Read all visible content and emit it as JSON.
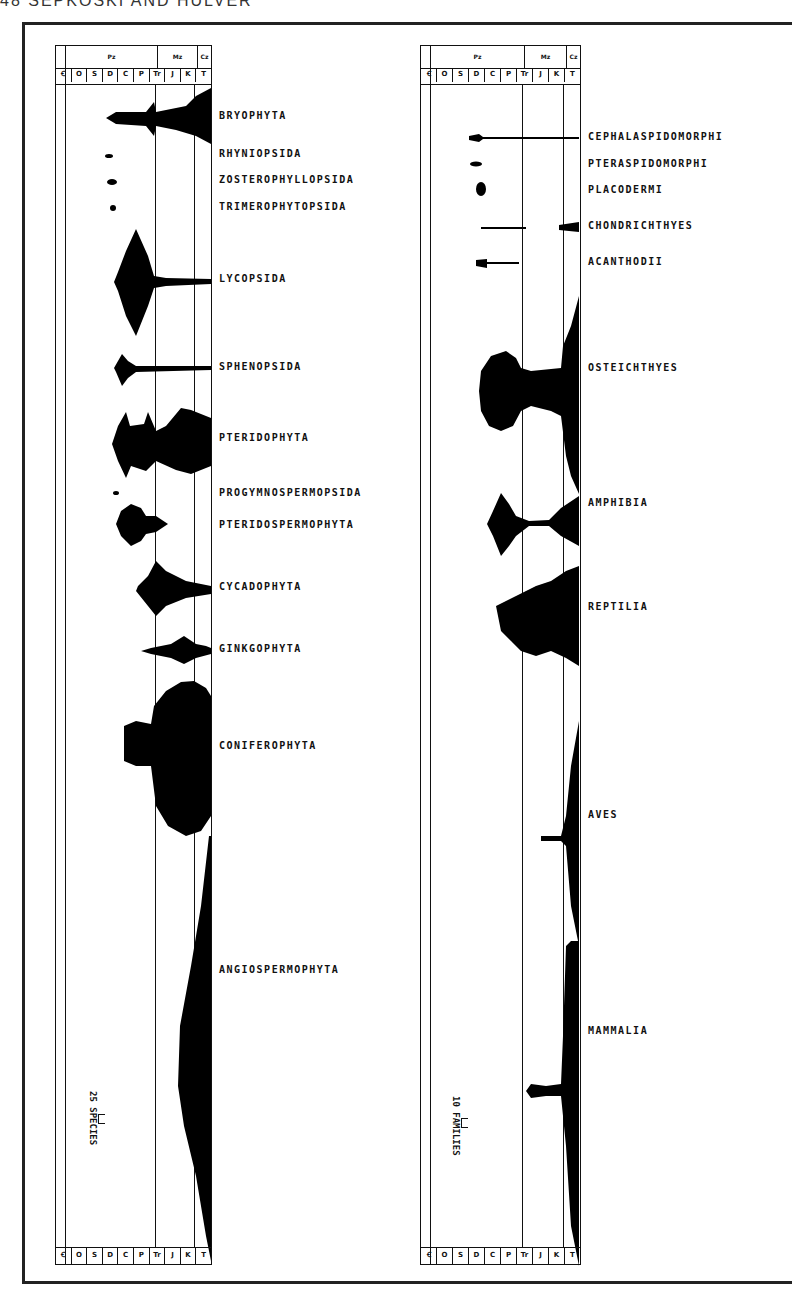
{
  "page": {
    "running_head": "48  SEPKOSKI AND HULVER"
  },
  "left_panel": {
    "timescale_periods": [
      "Ꞓ",
      "O",
      "S",
      "D",
      "C",
      "P",
      "Tr",
      "J",
      "K",
      "T"
    ],
    "timescale_eras": [
      "Pz",
      "Mz",
      "Cz"
    ],
    "scale_label": "25 SPECIES",
    "taxa": [
      {
        "name": "BRYOPHYTA"
      },
      {
        "name": "RHYNIOPSIDA"
      },
      {
        "name": "ZOSTEROPHYLLOPSIDA"
      },
      {
        "name": "TRIMEROPHYTOPSIDA"
      },
      {
        "name": "LYCOPSIDA"
      },
      {
        "name": "SPHENOPSIDA"
      },
      {
        "name": "PTERIDOPHYTA"
      },
      {
        "name": "PROGYMNOSPERMOPSIDA"
      },
      {
        "name": "PTERIDOSPERMOPHYTA"
      },
      {
        "name": "CYCADOPHYTA"
      },
      {
        "name": "GINKGOPHYTA"
      },
      {
        "name": "CONIFEROPHYTA"
      },
      {
        "name": "ANGIOSPERMOPHYTA"
      }
    ]
  },
  "right_panel": {
    "timescale_periods": [
      "Ꞓ",
      "O",
      "S",
      "D",
      "C",
      "P",
      "Tr",
      "J",
      "K",
      "T"
    ],
    "timescale_eras": [
      "Pz",
      "Mz",
      "Cz"
    ],
    "scale_label": "10 FAMILIES",
    "taxa": [
      {
        "name": "CEPHALASPIDOMORPHI"
      },
      {
        "name": "PTERASPIDOMORPHI"
      },
      {
        "name": "PLACODERMI"
      },
      {
        "name": "CHONDRICHTHYES"
      },
      {
        "name": "ACANTHODII"
      },
      {
        "name": "OSTEICHTHYES"
      },
      {
        "name": "AMPHIBIA"
      },
      {
        "name": "REPTILIA"
      },
      {
        "name": "AVES"
      },
      {
        "name": "MAMMALIA"
      }
    ]
  }
}
